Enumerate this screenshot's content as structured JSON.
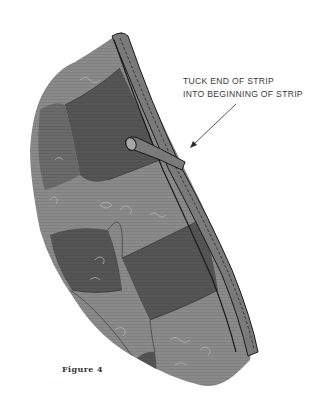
{
  "figure": {
    "caption": "Figure 4",
    "annotation": {
      "line1": "TUCK END OF STRIP",
      "line2": "INTO BEGINNING OF STRIP"
    },
    "colors": {
      "background": "#ffffff",
      "dark_patch": "#555555",
      "light_patch": "#8a8a8a",
      "binding": "#7a7a7a",
      "outline": "#1a1a1a",
      "swirl": "#b8b8b8"
    }
  }
}
